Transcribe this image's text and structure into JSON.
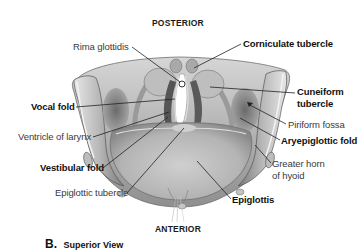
{
  "figure": {
    "orientation": {
      "top": "POSTERIOR",
      "bottom": "ANTERIOR"
    },
    "caption": {
      "letter": "B.",
      "title": "Superior View"
    },
    "labels": {
      "rima_glottidis": "Rima glottidis",
      "corniculate_tubercle": "Corniculate tubercle",
      "vocal_fold": "Vocal fold",
      "cuneiform_tubercle_line1": "Cuneiform",
      "cuneiform_tubercle_line2": "tubercle",
      "piriform_fossa": "Piriform fossa",
      "ventricle_of_larynx": "Ventricle of larynx",
      "aryepiglottic_fold": "Aryepiglottic fold",
      "vestibular_fold": "Vestibular fold",
      "greater_horn_line1": "Greater horn",
      "greater_horn_line2": "of hyoid",
      "epiglottic_tubercle": "Epiglottic tubercle",
      "epiglottis": "Epiglottis"
    },
    "colors": {
      "background": "#ffffff",
      "tissue_light": "#d9d9d9",
      "tissue_mid": "#a8a8a8",
      "tissue_dark": "#6e6e6e",
      "leader_line": "#222222",
      "label_bold": "#111111",
      "label_regular": "#3a3a3a"
    }
  }
}
